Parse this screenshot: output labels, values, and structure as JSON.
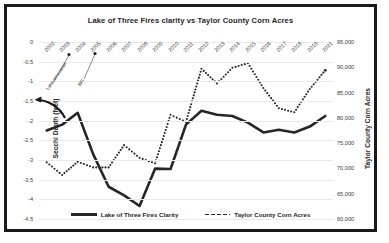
{
  "chart_data": {
    "type": "line",
    "title": "Lake of Three Fires clarity vs Taylor County Corn Acres",
    "xlabel": "",
    "ylabel": "Secchi Depth (feet)",
    "y2label": "Taylor County Corn Acres",
    "grid": true,
    "legend_position": "bottom",
    "categories": [
      "2002",
      "2003",
      "2004",
      "2005",
      "2006",
      "2007",
      "2008",
      "2009",
      "2010",
      "2011",
      "2012",
      "2013",
      "2014",
      "2015",
      "2016",
      "2017",
      "2018",
      "2019",
      "2021"
    ],
    "ylim": [
      -4.5,
      0
    ],
    "yticks": [
      "0",
      "-0.5",
      "-1",
      "-1.5",
      "-2",
      "-2.5",
      "-3",
      "-3.5",
      "-4",
      "-4.5"
    ],
    "y2lim": [
      60000,
      95000
    ],
    "y2ticks": [
      "95,000",
      "90,000",
      "85,000",
      "80,000",
      "75,000",
      "70,000",
      "65,000",
      "60,000"
    ],
    "series": [
      {
        "name": "Lake of Three Fires Clarity",
        "axis": "left",
        "style": "solid",
        "color": "#262626",
        "values": [
          -2.25,
          -2.1,
          -1.8,
          -2.85,
          -3.68,
          -3.9,
          -4.17,
          -3.22,
          -3.23,
          -2.1,
          -1.75,
          -1.85,
          -1.88,
          -2.05,
          -2.3,
          -2.23,
          -2.3,
          -2.15,
          -1.88
        ]
      },
      {
        "name": "Taylor County Corn Acres",
        "axis": "right",
        "style": "dotted",
        "color": "#262626",
        "values": [
          71200,
          68700,
          71300,
          70200,
          70200,
          74600,
          72100,
          71000,
          80600,
          79200,
          89700,
          86800,
          89900,
          90800,
          85900,
          81900,
          81100,
          85700,
          89400
        ]
      }
    ],
    "annotations": [
      {
        "text": "Lake renovation",
        "year": "2004"
      },
      {
        "text": "BFI",
        "year": "2005"
      }
    ]
  },
  "legend": {
    "items": [
      {
        "label": "Lake of Three Fires Clarity",
        "marker": "solid-line-swatch"
      },
      {
        "label": "Taylor County Corn Acres",
        "marker": "dotted-line-swatch"
      }
    ]
  }
}
